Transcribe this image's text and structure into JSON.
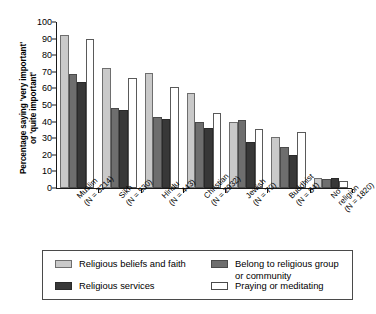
{
  "chart_data": {
    "type": "bar",
    "title": "",
    "xlabel": "",
    "ylabel": "Percentage saying 'very important'\nor 'quite important'",
    "ylim": [
      0,
      100
    ],
    "yticks": [
      0,
      10,
      20,
      30,
      40,
      50,
      60,
      70,
      80,
      90,
      100
    ],
    "grid": false,
    "legend_position": "bottom",
    "categories": [
      "Muslim\n(N = 3214)",
      "Sikh\n(N = 530)",
      "Hindu\n(N = 443)",
      "Christian\n(N = 2932)",
      "Jewish\n(N = 70)",
      "Buddhist\n(N = 84)",
      "No religion\n(N = 1820)"
    ],
    "category_names": [
      "Muslim",
      "Sikh",
      "Hindu",
      "Christian",
      "Jewish",
      "Buddhist",
      "No religion"
    ],
    "category_counts": [
      "(N = 3214)",
      "(N = 530)",
      "(N = 443)",
      "(N = 2932)",
      "(N = 70)",
      "(N = 84)",
      "(N = 1820)"
    ],
    "series": [
      {
        "name": "Religious beliefs and faith",
        "color": "#c9c9c9",
        "values": [
          92,
          72.5,
          69.5,
          57,
          40,
          31,
          6
        ]
      },
      {
        "name": "Belong to religious group or community",
        "color": "#6e6e6e",
        "values": [
          68.5,
          48.5,
          43,
          40,
          41,
          25,
          5.5
        ]
      },
      {
        "name": "Religious services",
        "color": "#383838",
        "values": [
          64,
          47,
          41.5,
          36,
          27.5,
          20,
          6
        ]
      },
      {
        "name": "Praying or meditating",
        "color": "#ffffff",
        "values": [
          89.5,
          66.5,
          61,
          45,
          35.5,
          34,
          4
        ]
      }
    ]
  },
  "legend": {
    "entries": [
      {
        "label": "Religious beliefs and faith",
        "series": 0
      },
      {
        "label": "Belong to religious group\nor community",
        "series": 1
      },
      {
        "label": "Religious services",
        "series": 2
      },
      {
        "label": "Praying or meditating",
        "series": 3
      }
    ]
  }
}
